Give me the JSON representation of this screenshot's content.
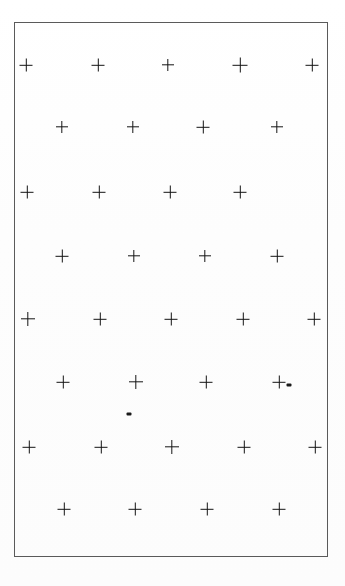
{
  "figure": {
    "background_color": "#fdfdfd",
    "ink_color": "#151515",
    "frame_color": "#5a5a5a",
    "canvas": {
      "width": 345,
      "height": 586
    },
    "frame": {
      "x": 14,
      "y": 22,
      "width": 314,
      "height": 535
    },
    "mark_glyph": "+",
    "mark_size": 13,
    "rows": [
      {
        "row_label": "row-1",
        "y": 65,
        "marks": [
          {
            "x": 26,
            "y": 65,
            "size": 13
          },
          {
            "x": 98,
            "y": 65,
            "size": 13
          },
          {
            "x": 168,
            "y": 65,
            "size": 12
          },
          {
            "x": 240,
            "y": 65,
            "size": 15
          },
          {
            "x": 312,
            "y": 65,
            "size": 13
          }
        ]
      },
      {
        "row_label": "row-2",
        "y": 127,
        "marks": [
          {
            "x": 62,
            "y": 127,
            "size": 12
          },
          {
            "x": 133,
            "y": 127,
            "size": 12
          },
          {
            "x": 203,
            "y": 127,
            "size": 13
          },
          {
            "x": 277,
            "y": 127,
            "size": 12
          }
        ]
      },
      {
        "row_label": "row-3",
        "y": 192,
        "marks": [
          {
            "x": 27,
            "y": 192,
            "size": 13
          },
          {
            "x": 99,
            "y": 192,
            "size": 13
          },
          {
            "x": 170,
            "y": 192,
            "size": 13
          },
          {
            "x": 240,
            "y": 192,
            "size": 13
          }
        ]
      },
      {
        "row_label": "row-4",
        "y": 256,
        "marks": [
          {
            "x": 62,
            "y": 256,
            "size": 13
          },
          {
            "x": 134,
            "y": 256,
            "size": 12
          },
          {
            "x": 205,
            "y": 256,
            "size": 12
          },
          {
            "x": 277,
            "y": 256,
            "size": 13
          }
        ]
      },
      {
        "row_label": "row-5",
        "y": 319,
        "marks": [
          {
            "x": 28,
            "y": 319,
            "size": 14
          },
          {
            "x": 100,
            "y": 319,
            "size": 13
          },
          {
            "x": 171,
            "y": 319,
            "size": 13
          },
          {
            "x": 243,
            "y": 319,
            "size": 13
          },
          {
            "x": 314,
            "y": 319,
            "size": 13
          }
        ]
      },
      {
        "row_label": "row-6",
        "y": 382,
        "marks": [
          {
            "x": 63,
            "y": 382,
            "size": 13
          },
          {
            "x": 136,
            "y": 382,
            "size": 14
          },
          {
            "x": 206,
            "y": 382,
            "size": 13
          },
          {
            "x": 279,
            "y": 382,
            "size": 13
          }
        ]
      },
      {
        "row_label": "row-7",
        "y": 447,
        "marks": [
          {
            "x": 29,
            "y": 447,
            "size": 13
          },
          {
            "x": 101,
            "y": 447,
            "size": 13
          },
          {
            "x": 172,
            "y": 447,
            "size": 14
          },
          {
            "x": 244,
            "y": 447,
            "size": 13
          },
          {
            "x": 315,
            "y": 447,
            "size": 13
          }
        ]
      },
      {
        "row_label": "row-8",
        "y": 509,
        "marks": [
          {
            "x": 64,
            "y": 509,
            "size": 13
          },
          {
            "x": 135,
            "y": 509,
            "size": 13
          },
          {
            "x": 207,
            "y": 509,
            "size": 13
          },
          {
            "x": 279,
            "y": 509,
            "size": 13
          }
        ]
      }
    ],
    "specks": [
      {
        "label": "speck-right",
        "x": 289,
        "y": 385,
        "width": 5,
        "height": 3
      },
      {
        "label": "speck-center",
        "x": 129,
        "y": 414,
        "width": 5,
        "height": 3
      }
    ]
  }
}
